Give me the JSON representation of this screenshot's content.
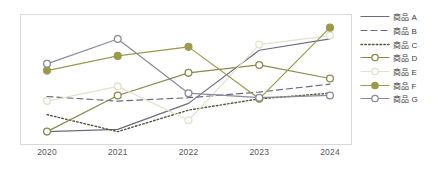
{
  "chart_data": {
    "type": "line",
    "title": "",
    "subtitle": "",
    "xlabel": "",
    "ylabel": "",
    "grid": false,
    "legend_position": "right",
    "categories": [
      "2020",
      "2021",
      "2022",
      "2023",
      "2024"
    ],
    "x": [
      2020,
      2021,
      2022,
      2023,
      2024
    ],
    "xlim": [
      2020,
      2024
    ],
    "ylim": [
      0,
      100
    ],
    "series": [
      {
        "name": "商品 A",
        "color": "#6b6b80",
        "line_style": "solid",
        "marker": "none",
        "values": [
          3,
          5,
          28,
          75,
          85
        ]
      },
      {
        "name": "商品 B",
        "color": "#6b6b80",
        "line_style": "dashed",
        "marker": "none",
        "values": [
          34,
          30,
          33,
          38,
          45
        ]
      },
      {
        "name": "商品 C",
        "color": "#55553a",
        "line_style": "dotted",
        "marker": "none",
        "values": [
          18,
          3,
          22,
          32,
          37
        ]
      },
      {
        "name": "商品 D",
        "color": "#8a8a4a",
        "line_style": "solid",
        "marker": "open-circle",
        "values": [
          3,
          35,
          55,
          62,
          50
        ]
      },
      {
        "name": "商品 E",
        "color": "#e2e2cc",
        "line_style": "solid",
        "marker": "open-circle",
        "values": [
          30,
          43,
          13,
          80,
          88
        ]
      },
      {
        "name": "商品 F",
        "color": "#9a9a4a",
        "line_style": "solid",
        "marker": "filled-circle",
        "values": [
          57,
          70,
          78,
          32,
          95
        ]
      },
      {
        "name": "商品 G",
        "color": "#8a8a9a",
        "line_style": "solid",
        "marker": "open-circle",
        "values": [
          63,
          85,
          37,
          33,
          35
        ]
      }
    ]
  },
  "legend": {
    "items": [
      {
        "label": "商品 A",
        "icon": "solid-line-icon"
      },
      {
        "label": "商品 B",
        "icon": "dashed-line-icon"
      },
      {
        "label": "商品 C",
        "icon": "dotted-line-icon"
      },
      {
        "label": "商品 D",
        "icon": "line-open-marker-icon"
      },
      {
        "label": "商品 E",
        "icon": "line-open-marker-icon"
      },
      {
        "label": "商品 F",
        "icon": "line-filled-marker-icon"
      },
      {
        "label": "商品 G",
        "icon": "line-open-marker-icon"
      }
    ]
  },
  "axis": {
    "x_tick_labels": [
      "2020",
      "2021",
      "2022",
      "2023",
      "2024"
    ]
  },
  "colors": {
    "background": "#ffffff",
    "frame": "#d8d8d8",
    "tick_label": "#555555",
    "legend_text": "#3c3c3c"
  }
}
